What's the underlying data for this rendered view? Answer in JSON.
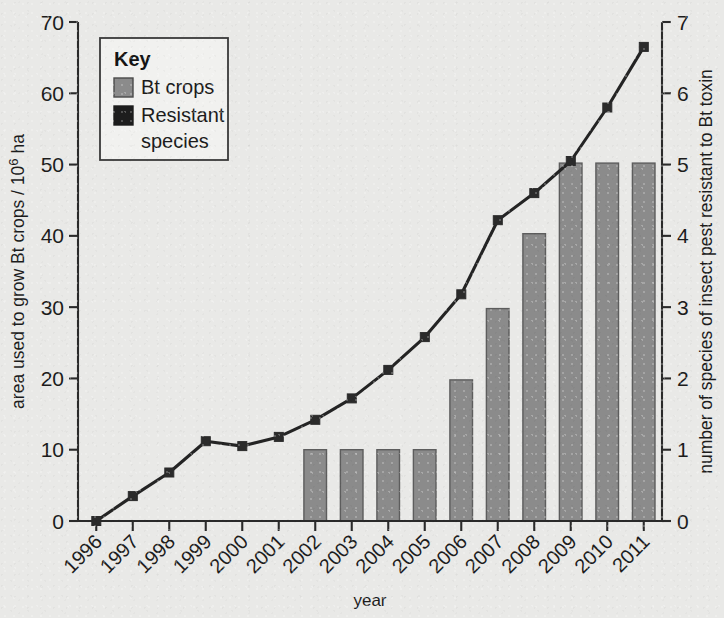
{
  "chart_data": {
    "type": "bar",
    "title": "",
    "subtitle": "",
    "xlabel": "year",
    "ylabel": "area used to grow Bt crops / 10⁶ ha",
    "y2label": "number of species of insect pest resistant to Bt toxin",
    "categories": [
      "1996",
      "1997",
      "1998",
      "1999",
      "2000",
      "2001",
      "2002",
      "2003",
      "2004",
      "2005",
      "2006",
      "2007",
      "2008",
      "2009",
      "2010",
      "2011"
    ],
    "xlim": [
      1995.5,
      2011.5
    ],
    "ylim": [
      0,
      70
    ],
    "y2lim": [
      0,
      7
    ],
    "yticks": [
      "0",
      "10",
      "20",
      "30",
      "40",
      "50",
      "60",
      "70"
    ],
    "y2ticks": [
      "0",
      "1",
      "2",
      "3",
      "4",
      "5",
      "6",
      "7"
    ],
    "grid": false,
    "legend_position": "upper-left-inside",
    "series": [
      {
        "name": "Bt crops",
        "type": "bar",
        "axis": "left",
        "color": "#8b8b8b",
        "edge_color": "#5d5d5d",
        "values": [
          null,
          null,
          null,
          null,
          null,
          null,
          10.0,
          10.0,
          10.0,
          10.0,
          19.8,
          29.8,
          40.3,
          50.2,
          50.2,
          50.2
        ]
      },
      {
        "name": "Resistant species",
        "type": "line",
        "axis": "right",
        "color": "#242424",
        "marker": "square",
        "values": [
          0,
          0.35,
          0.68,
          1.12,
          1.05,
          1.18,
          1.42,
          1.72,
          2.12,
          2.58,
          3.18,
          4.22,
          4.6,
          5.05,
          5.8,
          6.65
        ]
      }
    ]
  },
  "axes": {
    "left": {
      "title_pre": "area used to grow Bt crops / 10",
      "title_sup": "6",
      "title_post": " ha"
    },
    "right": {
      "title": "number of species of insect pest resistant to Bt toxin"
    },
    "bottom": {
      "title": "year"
    }
  },
  "legend": {
    "title": "Key",
    "items": [
      {
        "label": "Bt crops",
        "swatch": "grey-square-swatch",
        "color": "#8b8b8b"
      },
      {
        "label": "Resistant",
        "label2": "species",
        "swatch": "black-square-swatch",
        "color": "#1d1d1d"
      }
    ]
  },
  "colors": {
    "background": "#e9e9e7",
    "bar_fill": "#8b8b8b",
    "line": "#242424",
    "axis": "#2a2a2a",
    "text": "#1c1c1c"
  }
}
